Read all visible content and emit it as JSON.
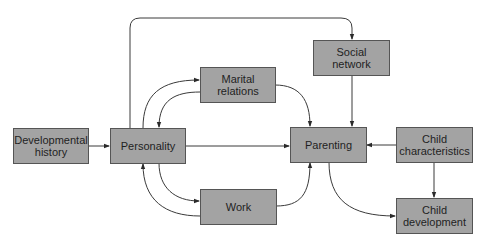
{
  "diagram": {
    "colors": {
      "box_fill": "#a3a3a3",
      "box_border": "#555555",
      "edge": "#3a3a3a",
      "background": "#ffffff"
    },
    "nodes": {
      "developmental_history": "Developmental\nhistory",
      "personality": "Personality",
      "marital_relations": "Marital\nrelations",
      "social_network": "Social\nnetwork",
      "parenting": "Parenting",
      "child_characteristics": "Child\ncharacteristics",
      "work": "Work",
      "child_development": "Child\ndevelopment"
    },
    "edges": [
      {
        "from": "Developmental history",
        "to": "Personality"
      },
      {
        "from": "Personality",
        "to": "Parenting"
      },
      {
        "from": "Personality",
        "to": "Marital relations"
      },
      {
        "from": "Marital relations",
        "to": "Personality"
      },
      {
        "from": "Personality",
        "to": "Work"
      },
      {
        "from": "Work",
        "to": "Personality"
      },
      {
        "from": "Personality",
        "to": "Social network"
      },
      {
        "from": "Marital relations",
        "to": "Parenting"
      },
      {
        "from": "Work",
        "to": "Parenting"
      },
      {
        "from": "Social network",
        "to": "Parenting"
      },
      {
        "from": "Child characteristics",
        "to": "Parenting"
      },
      {
        "from": "Child characteristics",
        "to": "Child development"
      },
      {
        "from": "Parenting",
        "to": "Child development"
      }
    ]
  }
}
